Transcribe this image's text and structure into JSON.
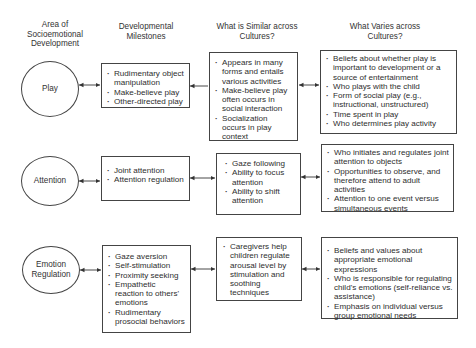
{
  "headers": {
    "area": "Area of Socioemotional Development",
    "milestones": "Developmental Milestones",
    "similar": "What is Similar across Cultures?",
    "varies": "What Varies across Cultures?"
  },
  "rows": [
    {
      "area": "Play",
      "milestones": [
        "Rudimentary object manipulation",
        "Make-believe play",
        "Other-directed play"
      ],
      "similar": [
        "Appears in many forms and entails various activities",
        "Make-believe play often occurs in social interaction",
        "Socialization occurs in play context"
      ],
      "varies": [
        "Beliefs about whether play is important to development or a source of entertainment",
        "Who plays with the child",
        "Form of social play (e.g., instructional, unstructured)",
        "Time spent in play",
        "Who determines play activity"
      ]
    },
    {
      "area": "Attention",
      "milestones": [
        "Joint attention",
        "Attention regulation"
      ],
      "similar": [
        "Gaze following",
        "Ability to focus attention",
        "Ability to shift attention"
      ],
      "varies": [
        "Who initiates and regulates joint attention to objects",
        "Opportunities to observe, and therefore attend to adult activities",
        "Attention to one event versus simultaneous events"
      ]
    },
    {
      "area": "Emotion Regulation",
      "milestones": [
        "Gaze aversion",
        "Self-stimulation",
        "Proximity seeking",
        "Empathetic reaction to others' emotions",
        "Rudimentary prosocial behaviors"
      ],
      "similar": [
        "Caregivers help children regulate arousal level by stimulation and soothing techniques"
      ],
      "varies": [
        "Beliefs and values about appropriate emotional expressions",
        "Who is responsible for regulating child's emotions (self-reliance vs. assistance)",
        "Emphasis on individual versus group emotional needs"
      ]
    }
  ]
}
